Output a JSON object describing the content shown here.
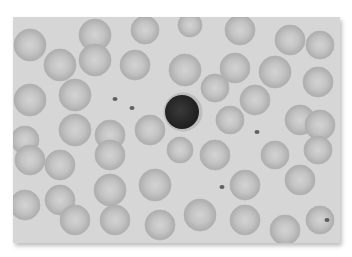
{
  "image": {
    "description": "Grayscale light micrograph of a peripheral blood smear showing red blood cells, a single central lymphocyte, and scattered platelets",
    "colors": {
      "background": "#d6d6d6",
      "rbc_edge": "#b4b4b4",
      "rbc_center": "#cfcfcf",
      "lymphocyte": "#2a2a2a",
      "platelet": "#3a3a3a",
      "border": "#ffffff"
    }
  },
  "cells": {
    "rbc": [
      [
        30,
        45,
        16
      ],
      [
        95,
        35,
        16
      ],
      [
        145,
        30,
        14
      ],
      [
        190,
        25,
        12
      ],
      [
        240,
        30,
        15
      ],
      [
        290,
        40,
        15
      ],
      [
        320,
        45,
        14
      ],
      [
        60,
        65,
        16
      ],
      [
        95,
        60,
        16
      ],
      [
        135,
        65,
        15
      ],
      [
        185,
        70,
        16
      ],
      [
        235,
        68,
        15
      ],
      [
        275,
        72,
        16
      ],
      [
        318,
        82,
        15
      ],
      [
        30,
        100,
        16
      ],
      [
        75,
        95,
        16
      ],
      [
        215,
        88,
        14
      ],
      [
        255,
        100,
        15
      ],
      [
        300,
        120,
        15
      ],
      [
        25,
        140,
        14
      ],
      [
        75,
        130,
        16
      ],
      [
        110,
        135,
        15
      ],
      [
        150,
        130,
        15
      ],
      [
        230,
        120,
        14
      ],
      [
        320,
        125,
        15
      ],
      [
        30,
        160,
        15
      ],
      [
        60,
        165,
        15
      ],
      [
        110,
        155,
        15
      ],
      [
        180,
        150,
        13
      ],
      [
        215,
        155,
        15
      ],
      [
        275,
        155,
        14
      ],
      [
        318,
        150,
        14
      ],
      [
        25,
        205,
        15
      ],
      [
        60,
        200,
        15
      ],
      [
        110,
        190,
        16
      ],
      [
        155,
        185,
        16
      ],
      [
        245,
        185,
        15
      ],
      [
        300,
        180,
        15
      ],
      [
        75,
        220,
        15
      ],
      [
        115,
        220,
        15
      ],
      [
        160,
        225,
        15
      ],
      [
        200,
        215,
        16
      ],
      [
        245,
        220,
        15
      ],
      [
        285,
        230,
        15
      ],
      [
        320,
        220,
        14
      ]
    ],
    "lymphocyte": [
      183,
      112,
      18
    ],
    "platelets": [
      [
        115,
        99
      ],
      [
        132,
        108
      ],
      [
        257,
        132
      ],
      [
        222,
        187
      ],
      [
        327,
        220
      ]
    ]
  }
}
